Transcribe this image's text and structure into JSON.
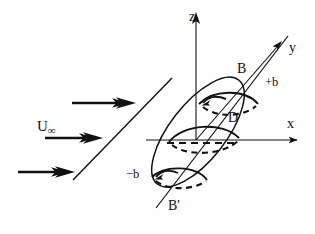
{
  "figure": {
    "background_color": "#fefefe",
    "stroke_color": "#111111",
    "labels": {
      "axis_z": "z",
      "axis_y": "y",
      "axis_x": "x",
      "point_b_upper": "B",
      "point_b_lower": "B'",
      "span_positive": "+b",
      "span_negative": "−b",
      "diameter": "D",
      "freestream_symbol": "U",
      "freestream_subscript": "∞"
    },
    "annotations": {
      "freestream_full": "U∞",
      "flow_arrow_count": 3,
      "cross_section_count": 3,
      "hidden_line_style": "dashed",
      "visible_line_style": "solid"
    },
    "geometry": {
      "origin": {
        "x": 196,
        "y": 140
      },
      "z_axis_top": {
        "x": 196,
        "y": 14
      },
      "x_axis_right": {
        "x": 303,
        "y": 140
      },
      "y_axis_tip": {
        "x": 284,
        "y": 40
      },
      "span_axis_upper_end": {
        "x": 285,
        "y": 39
      },
      "span_axis_lower_end": {
        "x": 158,
        "y": 205
      },
      "body_center": {
        "x": 198,
        "y": 132
      },
      "body_semi_major": 66,
      "body_semi_minor": 28,
      "body_tilt_degrees": -52
    }
  }
}
